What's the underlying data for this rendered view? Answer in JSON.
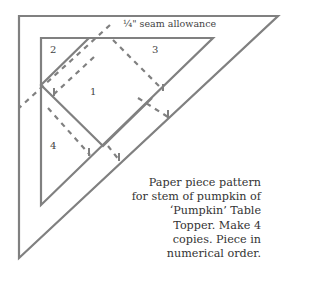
{
  "diagram": {
    "seam_label": "¼\" seam allowance",
    "piece_labels": [
      {
        "id": "2",
        "x": 50,
        "y": 44
      },
      {
        "id": "3",
        "x": 152,
        "y": 44
      },
      {
        "id": "1",
        "x": 90,
        "y": 86
      },
      {
        "id": "4",
        "x": 50,
        "y": 140
      }
    ],
    "line_color": "#808080",
    "caption_lines": [
      "Paper piece pattern",
      "for stem of pumpkin of",
      "‘Pumpkin’ Table",
      "Topper. Make 4",
      "copies. Piece in",
      "numerical order."
    ]
  }
}
